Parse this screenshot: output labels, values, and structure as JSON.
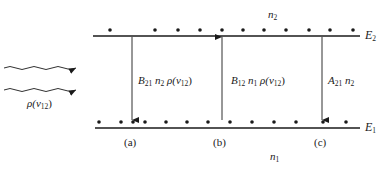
{
  "diagram": {
    "levels": {
      "upper": {
        "label": "E",
        "sub": "2",
        "population_label": "n",
        "population_sub": "2",
        "y": 36
      },
      "lower": {
        "label": "E",
        "sub": "1",
        "population_label": "n",
        "population_sub": "1",
        "y": 128
      }
    },
    "radiation": {
      "label_prefix": "ρ(ν",
      "label_sub": "12",
      "label_suffix": ")"
    },
    "transitions": [
      {
        "id": "a",
        "case_label": "(a)",
        "direction": "down",
        "coef": "B",
        "coef_sub": "21",
        "pop": "n",
        "pop_sub": "2",
        "field_prefix": "ρ(ν",
        "field_sub": "12",
        "field_suffix": ")",
        "x": 132
      },
      {
        "id": "b",
        "case_label": "(b)",
        "direction": "up",
        "coef": "B",
        "coef_sub": "12",
        "pop": "n",
        "pop_sub": "1",
        "field_prefix": "ρ(ν",
        "field_sub": "12",
        "field_suffix": ")",
        "x": 222
      },
      {
        "id": "c",
        "case_label": "(c)",
        "direction": "down",
        "coef": "A",
        "coef_sub": "21",
        "pop": "n",
        "pop_sub": "2",
        "x": 322
      }
    ],
    "upper_dots_x": [
      110,
      155,
      178,
      200,
      222,
      243,
      264,
      286,
      309,
      330,
      353
    ],
    "lower_dots_x": [
      99,
      121,
      133,
      145,
      166,
      187,
      208,
      230,
      252,
      274,
      296,
      323,
      346
    ],
    "colors": {
      "ink": "#1a1a1a",
      "background": "#ffffff"
    }
  }
}
